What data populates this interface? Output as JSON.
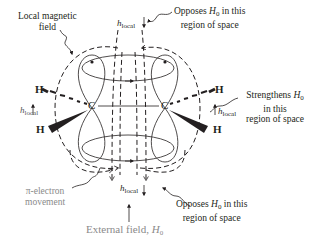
{
  "diagram": {
    "labels": {
      "local_magnetic_field": [
        "Local magnetic",
        "field"
      ],
      "opposes_top": [
        "Opposes",
        "H",
        "0",
        " in this",
        "region of space"
      ],
      "strengthens": [
        "Strengthens ",
        "H",
        "0",
        "in this",
        "region of space"
      ],
      "opposes_bottom": [
        "Opposes ",
        "H",
        "0",
        " in this",
        "region of space"
      ],
      "pi_electron": [
        "π-electron",
        "movement"
      ],
      "external_field": [
        "External field, ",
        "H",
        "0"
      ],
      "h_local": "h",
      "h_local_sub": "local"
    },
    "atoms": {
      "carbon_left": "C",
      "carbon_right": "C",
      "h_top_left": "H",
      "h_bottom_left": "H",
      "h_top_right": "H",
      "h_bottom_right": "H"
    },
    "colors": {
      "ink": "#231f20",
      "gray_text": "#8a8a8a"
    }
  }
}
